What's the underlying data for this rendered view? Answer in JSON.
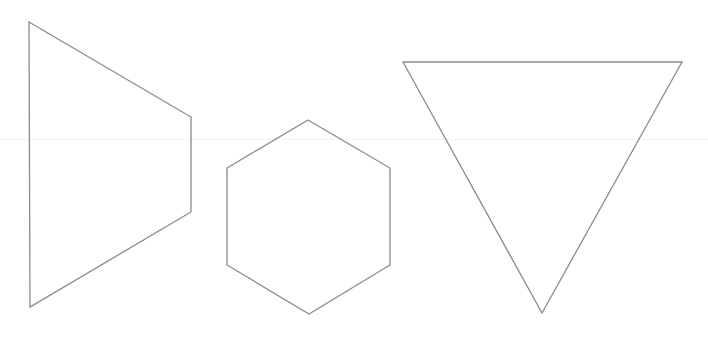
{
  "diagram": {
    "background": "#ffffff",
    "stroke_color": "#8a8a8a",
    "stroke_width": 1.3,
    "shapes": [
      {
        "name": "trapezoid",
        "points": "29,22 191,117 191,212 30,307"
      },
      {
        "name": "hexagon",
        "points": "308,120 390,168 390,265 309,314 227,265 227,168"
      },
      {
        "name": "inverted-triangle",
        "points": "403,62 682,62 542,313"
      }
    ]
  }
}
